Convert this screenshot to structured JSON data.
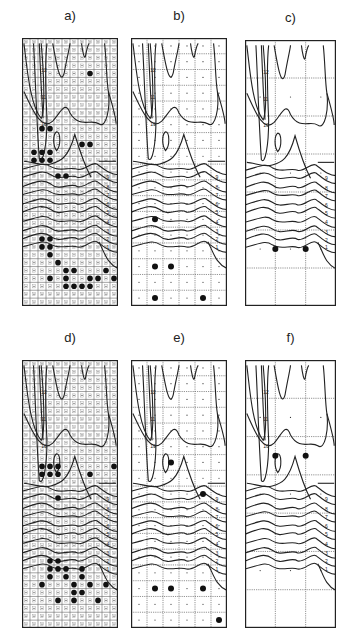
{
  "figure": {
    "panels": [
      {
        "id": "a",
        "label": "a)",
        "x": 22,
        "y": 38,
        "w": 96,
        "h": 268,
        "cols": 12,
        "rows": 34,
        "dots": true,
        "big_dots": [
          [
            8,
            4
          ],
          [
            2,
            11
          ],
          [
            3,
            11
          ],
          [
            7,
            13
          ],
          [
            8,
            13
          ],
          [
            1,
            14
          ],
          [
            2,
            14
          ],
          [
            3,
            14
          ],
          [
            1,
            15
          ],
          [
            2,
            15
          ],
          [
            3,
            15
          ],
          [
            4,
            17
          ],
          [
            5,
            17
          ],
          [
            2,
            25
          ],
          [
            3,
            25
          ],
          [
            2,
            26
          ],
          [
            3,
            26
          ],
          [
            3,
            27
          ],
          [
            4,
            28
          ],
          [
            5,
            29
          ],
          [
            6,
            29
          ],
          [
            10,
            29
          ],
          [
            3,
            30
          ],
          [
            5,
            30
          ],
          [
            8,
            30
          ],
          [
            9,
            30
          ],
          [
            11,
            30
          ],
          [
            5,
            31
          ],
          [
            6,
            31
          ],
          [
            7,
            31
          ],
          [
            8,
            31
          ]
        ]
      },
      {
        "id": "b",
        "label": "b)",
        "x": 131,
        "y": 38,
        "w": 96,
        "h": 268,
        "cols": 6,
        "rows": 17,
        "dots": true,
        "big_dots": [
          [
            1,
            11
          ],
          [
            1,
            14
          ],
          [
            2,
            14
          ],
          [
            1,
            16
          ],
          [
            4,
            16
          ]
        ]
      },
      {
        "id": "c",
        "label": "c)",
        "x": 245,
        "y": 40,
        "w": 91,
        "h": 266,
        "cols": 3,
        "rows": 7,
        "dots": true,
        "big_dots": [
          [
            1,
            5.5
          ],
          [
            2,
            5.5
          ]
        ]
      },
      {
        "id": "d",
        "label": "d)",
        "x": 22,
        "y": 360,
        "w": 96,
        "h": 268,
        "cols": 12,
        "rows": 34,
        "dots": true,
        "big_dots": [
          [
            2,
            13
          ],
          [
            3,
            13
          ],
          [
            4,
            13
          ],
          [
            2,
            14
          ],
          [
            3,
            14
          ],
          [
            4,
            14
          ],
          [
            8,
            14
          ],
          [
            11,
            13
          ],
          [
            4,
            17
          ],
          [
            3,
            25
          ],
          [
            4,
            25
          ],
          [
            3,
            26
          ],
          [
            4,
            26
          ],
          [
            5,
            26
          ],
          [
            7,
            26
          ],
          [
            3,
            27
          ],
          [
            5,
            27
          ],
          [
            7,
            27
          ],
          [
            2,
            28
          ],
          [
            6,
            28
          ],
          [
            8,
            28
          ],
          [
            6,
            29
          ],
          [
            7,
            29
          ],
          [
            10,
            28
          ],
          [
            4,
            30
          ],
          [
            6,
            30
          ],
          [
            9,
            30
          ]
        ]
      },
      {
        "id": "e",
        "label": "e)",
        "x": 131,
        "y": 360,
        "w": 96,
        "h": 268,
        "cols": 6,
        "rows": 17,
        "dots": true,
        "big_dots": [
          [
            2,
            6
          ],
          [
            4,
            8
          ],
          [
            1,
            14
          ],
          [
            2,
            14
          ],
          [
            4,
            14
          ],
          [
            5,
            16
          ]
        ]
      },
      {
        "id": "f",
        "label": "f)",
        "x": 245,
        "y": 360,
        "w": 91,
        "h": 268,
        "cols": 3,
        "rows": 7,
        "dots": true,
        "big_dots": [
          [
            1,
            2.5
          ],
          [
            2,
            2.5
          ]
        ]
      }
    ],
    "contour_labels": [
      "12",
      "11",
      "10",
      "9",
      "8",
      "7",
      "6",
      "5",
      "4",
      "3",
      "2",
      "1"
    ],
    "caption": ""
  }
}
